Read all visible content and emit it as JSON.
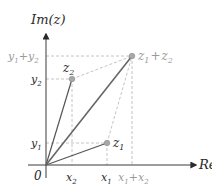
{
  "diagram": {
    "axes": {
      "x_label": "Re(z)",
      "y_label": "Im(z)",
      "origin_label": "0"
    },
    "points": [
      {
        "id": "z1",
        "label": "z",
        "sub": "1"
      },
      {
        "id": "z2",
        "label": "z",
        "sub": "2"
      },
      {
        "id": "sum",
        "label": "z",
        "sub": "1",
        "plus": "+",
        "label2": "z",
        "sub2": "2"
      }
    ],
    "x_ticks": {
      "x2": {
        "label": "x",
        "sub": "2"
      },
      "x1": {
        "label": "x",
        "sub": "1"
      },
      "x1x2": {
        "label": "x",
        "sub": "1",
        "plus": "+",
        "label2": "x",
        "sub2": "2"
      }
    },
    "y_ticks": {
      "y1": {
        "label": "y",
        "sub": "1"
      },
      "y2": {
        "label": "y",
        "sub": "2"
      },
      "y1y2": {
        "label": "y",
        "sub": "1",
        "plus": "+",
        "label2": "y",
        "sub2": "2"
      }
    },
    "colors": {
      "axis": "#3a3a3a",
      "vector": "#555555",
      "dashed": "#b5b5b5",
      "point": "#a8a8a8",
      "gray_label": "#9a9a9a"
    }
  }
}
